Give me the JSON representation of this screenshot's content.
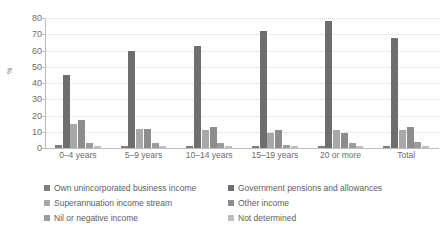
{
  "chart_data": {
    "type": "bar",
    "title": "",
    "xlabel": "",
    "ylabel": "%",
    "ylim": [
      0,
      80
    ],
    "yticks": [
      0,
      10,
      20,
      30,
      40,
      50,
      60,
      70,
      80
    ],
    "grid": true,
    "legend_position": "bottom",
    "categories": [
      "0–4 years",
      "5–9 years",
      "10–14 years",
      "15–19 years",
      "20 or more",
      "Total"
    ],
    "series": [
      {
        "name": "Own unincorporated business income",
        "color": "#7f7f7f",
        "values": [
          2,
          1,
          1,
          1,
          1,
          1
        ]
      },
      {
        "name": "Government pensions and allowances",
        "color": "#6e6e6e",
        "values": [
          45,
          60,
          63,
          72,
          78,
          68
        ]
      },
      {
        "name": "Superannuation income stream",
        "color": "#a8a8a8",
        "values": [
          15,
          12,
          11,
          9,
          11,
          11
        ]
      },
      {
        "name": "Other income",
        "color": "#8d8d8d",
        "values": [
          17,
          12,
          13,
          11,
          9,
          13
        ]
      },
      {
        "name": "Nil or negative income",
        "color": "#9c9c9c",
        "values": [
          3,
          3,
          3,
          2,
          3,
          4
        ]
      },
      {
        "name": "Not determined",
        "color": "#bfbfbf",
        "values": [
          1,
          1,
          1,
          1,
          1,
          1
        ]
      }
    ]
  },
  "legend": {
    "items": [
      {
        "label": "Own unincorporated business income",
        "color": "#7f7f7f"
      },
      {
        "label": "Government pensions and allowances",
        "color": "#6e6e6e"
      },
      {
        "label": "Superannuation income stream",
        "color": "#a8a8a8"
      },
      {
        "label": "Other income",
        "color": "#8d8d8d"
      },
      {
        "label": "Nil or negative income",
        "color": "#9c9c9c"
      },
      {
        "label": "Not determined",
        "color": "#bfbfbf"
      }
    ]
  }
}
